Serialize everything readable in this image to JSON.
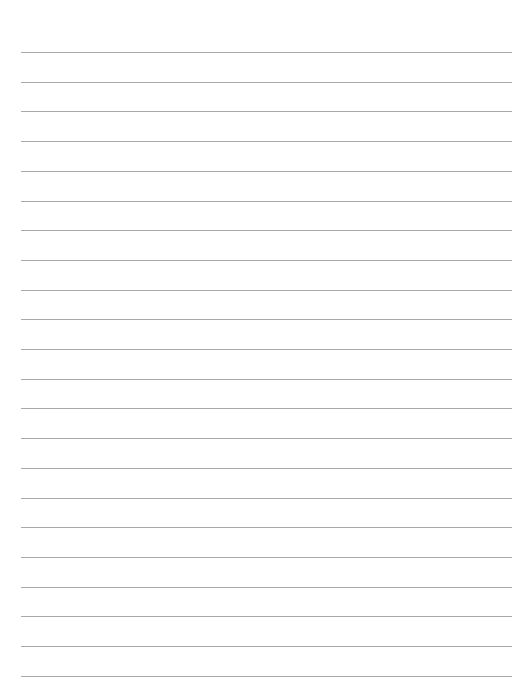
{
  "page": {
    "type": "lined-paper",
    "background_color": "#ffffff",
    "line_color": "#a9a9a9",
    "line_count": 22,
    "first_line_y": 52,
    "line_spacing": 29.7,
    "line_left": 21,
    "line_right": 512
  }
}
